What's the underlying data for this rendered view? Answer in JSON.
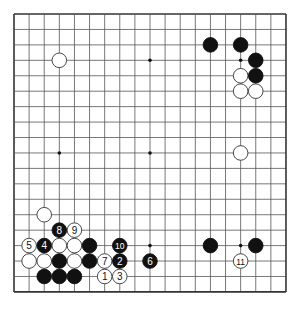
{
  "board": {
    "size": 19,
    "origin_x": 14,
    "origin_y": 14,
    "spacing_x": 15.11,
    "spacing_y": 15.44,
    "stone_radius": 7.3,
    "line_color": "#555555",
    "border_color": "#333333",
    "black_color": "#111111",
    "white_fill": "#ffffff",
    "white_stroke": "#333333",
    "hoshi": [
      [
        3,
        3
      ],
      [
        9,
        3
      ],
      [
        15,
        3
      ],
      [
        3,
        9
      ],
      [
        9,
        9
      ],
      [
        15,
        9
      ],
      [
        3,
        15
      ],
      [
        9,
        15
      ],
      [
        15,
        15
      ]
    ]
  },
  "stones": [
    {
      "color": "white",
      "x": 3,
      "y": 3
    },
    {
      "color": "black",
      "x": 13,
      "y": 2
    },
    {
      "color": "black",
      "x": 15,
      "y": 2
    },
    {
      "color": "black",
      "x": 16,
      "y": 3
    },
    {
      "color": "white",
      "x": 15,
      "y": 4
    },
    {
      "color": "black",
      "x": 16,
      "y": 4
    },
    {
      "color": "white",
      "x": 15,
      "y": 5
    },
    {
      "color": "white",
      "x": 16,
      "y": 5
    },
    {
      "color": "white",
      "x": 15,
      "y": 9
    },
    {
      "color": "white",
      "x": 2,
      "y": 13
    },
    {
      "color": "black",
      "x": 3,
      "y": 14,
      "label": "8"
    },
    {
      "color": "white",
      "x": 4,
      "y": 14,
      "label": "9"
    },
    {
      "color": "white",
      "x": 1,
      "y": 15,
      "label": "5"
    },
    {
      "color": "black",
      "x": 2,
      "y": 15,
      "label": "4"
    },
    {
      "color": "white",
      "x": 3,
      "y": 15
    },
    {
      "color": "white",
      "x": 4,
      "y": 15
    },
    {
      "color": "black",
      "x": 5,
      "y": 15
    },
    {
      "color": "black",
      "x": 7,
      "y": 15,
      "label": "10"
    },
    {
      "color": "white",
      "x": 1,
      "y": 16
    },
    {
      "color": "white",
      "x": 2,
      "y": 16
    },
    {
      "color": "black",
      "x": 3,
      "y": 16
    },
    {
      "color": "white",
      "x": 4,
      "y": 16
    },
    {
      "color": "black",
      "x": 5,
      "y": 16
    },
    {
      "color": "white",
      "x": 6,
      "y": 16,
      "label": "7"
    },
    {
      "color": "black",
      "x": 7,
      "y": 16,
      "label": "2"
    },
    {
      "color": "black",
      "x": 9,
      "y": 16,
      "label": "6"
    },
    {
      "color": "black",
      "x": 2,
      "y": 17
    },
    {
      "color": "black",
      "x": 3,
      "y": 17
    },
    {
      "color": "black",
      "x": 4,
      "y": 17
    },
    {
      "color": "white",
      "x": 6,
      "y": 17,
      "label": "1"
    },
    {
      "color": "white",
      "x": 7,
      "y": 17,
      "label": "3"
    },
    {
      "color": "black",
      "x": 13,
      "y": 15
    },
    {
      "color": "black",
      "x": 16,
      "y": 15
    },
    {
      "color": "white",
      "x": 15,
      "y": 16,
      "label": "11"
    }
  ]
}
